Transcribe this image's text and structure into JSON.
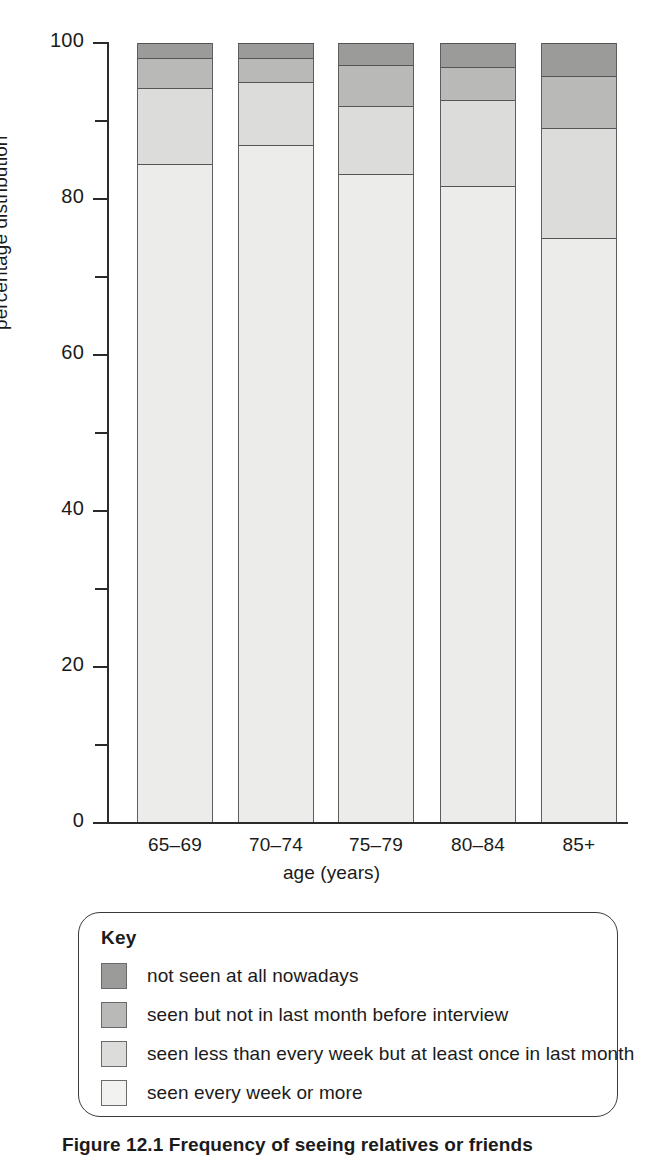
{
  "chart_data": {
    "type": "bar",
    "subtype": "stacked-100-percent",
    "title": "",
    "xlabel": "age (years)",
    "ylabel": "percentage distribution",
    "categories": [
      "65–69",
      "70–74",
      "75–79",
      "80–84",
      "85+"
    ],
    "ylim": [
      0,
      100
    ],
    "yticks": [
      0,
      20,
      40,
      60,
      80,
      100
    ],
    "ytick_labels": [
      "0",
      "20",
      "40",
      "60",
      "80",
      "100"
    ],
    "yminor_ticks": [
      10,
      30,
      50,
      70,
      90
    ],
    "grid": false,
    "legend_position": "below-axes",
    "stack_order_bottom_to_top": [
      "seen every week or more",
      "seen less than every week but at least once in last month",
      "seen but not in last month before interview",
      "not seen at all nowadays"
    ],
    "series": [
      {
        "name": "seen every week or more",
        "color": "#ecedeb",
        "values": [
          84.5,
          86.9,
          83.2,
          81.7,
          75.0
        ]
      },
      {
        "name": "seen less than every week but at least once in last month",
        "color": "#dcddda",
        "values": [
          9.7,
          8.1,
          8.7,
          11.0,
          14.1
        ]
      },
      {
        "name": "seen but not in last month before interview",
        "color": "#b9bab7",
        "values": [
          3.9,
          3.1,
          5.3,
          4.2,
          6.7
        ]
      },
      {
        "name": "not seen at all nowadays",
        "color": "#9b9c99",
        "values": [
          1.9,
          1.9,
          2.8,
          3.1,
          4.2
        ]
      }
    ]
  },
  "axes": {
    "y_title": "percentage distribution",
    "x_title": "age (years)"
  },
  "key": {
    "title": "Key",
    "items": [
      {
        "label": "not seen at all nowadays",
        "color": "#9b9c99"
      },
      {
        "label": "seen but not in last month before interview",
        "color": "#b9bab7"
      },
      {
        "label": "seen less than every week but at least once in last month",
        "color": "#dcddda"
      },
      {
        "label": "seen every week or more",
        "color": "#f2f3f1"
      }
    ]
  },
  "caption": {
    "text": "Figure 12.1 Frequency of seeing relatives or friends"
  }
}
